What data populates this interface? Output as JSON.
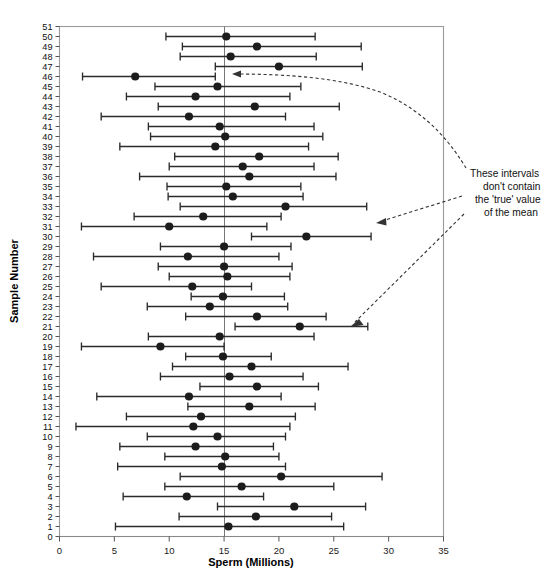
{
  "chart_data": {
    "type": "scatter",
    "title": "",
    "xlabel": "Sperm (Millions)",
    "ylabel": "Sample Number",
    "xlim": [
      0,
      35
    ],
    "ylim": [
      0,
      51
    ],
    "xticks": [
      0,
      5,
      10,
      15,
      20,
      25,
      30,
      35
    ],
    "xticklabels": [
      "0",
      "5",
      "10",
      "15",
      "20",
      "25",
      "30",
      "35"
    ],
    "yticks": [
      0,
      1,
      2,
      3,
      4,
      5,
      6,
      7,
      8,
      9,
      10,
      11,
      12,
      13,
      14,
      15,
      16,
      17,
      18,
      19,
      20,
      21,
      22,
      23,
      24,
      25,
      26,
      27,
      28,
      29,
      30,
      31,
      32,
      33,
      34,
      35,
      36,
      37,
      38,
      39,
      40,
      41,
      42,
      43,
      44,
      45,
      46,
      47,
      48,
      49,
      50,
      51
    ],
    "grid": false,
    "legend": null,
    "reference_line": {
      "x": 15.0,
      "label": "true mean"
    },
    "series": [
      {
        "name": "95% Confidence Intervals",
        "point_label": "sample mean",
        "interval_label": "confidence interval",
        "points": [
          {
            "sample": 50,
            "mean": 15.2,
            "low": 9.7,
            "high": 23.3,
            "contains_true": true
          },
          {
            "sample": 49,
            "mean": 18.0,
            "low": 11.2,
            "high": 27.5,
            "contains_true": true
          },
          {
            "sample": 48,
            "mean": 15.6,
            "low": 11.0,
            "high": 23.4,
            "contains_true": true
          },
          {
            "sample": 47,
            "mean": 20.0,
            "low": 14.2,
            "high": 27.6,
            "contains_true": true
          },
          {
            "sample": 46,
            "mean": 6.9,
            "low": 2.1,
            "high": 14.2,
            "contains_true": false
          },
          {
            "sample": 45,
            "mean": 14.4,
            "low": 8.7,
            "high": 22.0,
            "contains_true": true
          },
          {
            "sample": 44,
            "mean": 12.4,
            "low": 6.1,
            "high": 21.0,
            "contains_true": true
          },
          {
            "sample": 43,
            "mean": 17.8,
            "low": 9.0,
            "high": 25.5,
            "contains_true": true
          },
          {
            "sample": 42,
            "mean": 11.8,
            "low": 3.8,
            "high": 20.6,
            "contains_true": true
          },
          {
            "sample": 41,
            "mean": 14.6,
            "low": 8.1,
            "high": 23.2,
            "contains_true": true
          },
          {
            "sample": 40,
            "mean": 15.1,
            "low": 8.3,
            "high": 24.0,
            "contains_true": true
          },
          {
            "sample": 39,
            "mean": 14.2,
            "low": 5.5,
            "high": 22.7,
            "contains_true": true
          },
          {
            "sample": 38,
            "mean": 18.2,
            "low": 10.5,
            "high": 25.4,
            "contains_true": true
          },
          {
            "sample": 37,
            "mean": 16.7,
            "low": 10.0,
            "high": 23.2,
            "contains_true": true
          },
          {
            "sample": 36,
            "mean": 17.3,
            "low": 7.3,
            "high": 25.2,
            "contains_true": true
          },
          {
            "sample": 35,
            "mean": 15.2,
            "low": 9.8,
            "high": 22.0,
            "contains_true": true
          },
          {
            "sample": 34,
            "mean": 15.8,
            "low": 9.9,
            "high": 22.2,
            "contains_true": true
          },
          {
            "sample": 33,
            "mean": 20.6,
            "low": 11.0,
            "high": 28.0,
            "contains_true": true
          },
          {
            "sample": 32,
            "mean": 13.1,
            "low": 6.8,
            "high": 20.2,
            "contains_true": true
          },
          {
            "sample": 31,
            "mean": 10.0,
            "low": 2.0,
            "high": 18.9,
            "contains_true": true
          },
          {
            "sample": 30,
            "mean": 22.5,
            "low": 17.5,
            "high": 28.4,
            "contains_true": false
          },
          {
            "sample": 29,
            "mean": 15.0,
            "low": 9.2,
            "high": 21.1,
            "contains_true": true
          },
          {
            "sample": 28,
            "mean": 11.7,
            "low": 3.1,
            "high": 20.0,
            "contains_true": true
          },
          {
            "sample": 27,
            "mean": 15.0,
            "low": 9.0,
            "high": 21.2,
            "contains_true": true
          },
          {
            "sample": 26,
            "mean": 15.3,
            "low": 10.0,
            "high": 21.0,
            "contains_true": true
          },
          {
            "sample": 25,
            "mean": 12.1,
            "low": 3.8,
            "high": 17.5,
            "contains_true": true
          },
          {
            "sample": 24,
            "mean": 14.9,
            "low": 12.0,
            "high": 20.5,
            "contains_true": true
          },
          {
            "sample": 23,
            "mean": 13.7,
            "low": 8.0,
            "high": 20.8,
            "contains_true": true
          },
          {
            "sample": 22,
            "mean": 18.0,
            "low": 11.5,
            "high": 24.3,
            "contains_true": true
          },
          {
            "sample": 21,
            "mean": 21.9,
            "low": 16.0,
            "high": 28.1,
            "contains_true": false
          },
          {
            "sample": 20,
            "mean": 14.6,
            "low": 8.1,
            "high": 23.2,
            "contains_true": true
          },
          {
            "sample": 19,
            "mean": 9.2,
            "low": 2.0,
            "high": 15.0,
            "contains_true": true
          },
          {
            "sample": 18,
            "mean": 14.9,
            "low": 11.5,
            "high": 19.3,
            "contains_true": true
          },
          {
            "sample": 17,
            "mean": 17.5,
            "low": 10.3,
            "high": 26.3,
            "contains_true": true
          },
          {
            "sample": 16,
            "mean": 15.5,
            "low": 9.2,
            "high": 22.2,
            "contains_true": true
          },
          {
            "sample": 15,
            "mean": 18.0,
            "low": 12.8,
            "high": 23.6,
            "contains_true": true
          },
          {
            "sample": 14,
            "mean": 11.8,
            "low": 3.4,
            "high": 20.2,
            "contains_true": true
          },
          {
            "sample": 13,
            "mean": 17.3,
            "low": 11.7,
            "high": 23.3,
            "contains_true": true
          },
          {
            "sample": 12,
            "mean": 12.9,
            "low": 6.1,
            "high": 21.5,
            "contains_true": true
          },
          {
            "sample": 11,
            "mean": 12.2,
            "low": 1.5,
            "high": 21.0,
            "contains_true": true
          },
          {
            "sample": 10,
            "mean": 14.4,
            "low": 8.0,
            "high": 20.6,
            "contains_true": true
          },
          {
            "sample": 9,
            "mean": 12.4,
            "low": 5.5,
            "high": 19.5,
            "contains_true": true
          },
          {
            "sample": 8,
            "mean": 15.1,
            "low": 9.6,
            "high": 20.0,
            "contains_true": true
          },
          {
            "sample": 7,
            "mean": 14.8,
            "low": 5.3,
            "high": 20.6,
            "contains_true": true
          },
          {
            "sample": 6,
            "mean": 20.2,
            "low": 11.0,
            "high": 29.4,
            "contains_true": true
          },
          {
            "sample": 5,
            "mean": 16.6,
            "low": 9.6,
            "high": 25.0,
            "contains_true": true
          },
          {
            "sample": 4,
            "mean": 11.6,
            "low": 5.8,
            "high": 18.6,
            "contains_true": true
          },
          {
            "sample": 3,
            "mean": 21.4,
            "low": 14.4,
            "high": 27.9,
            "contains_true": true
          },
          {
            "sample": 2,
            "mean": 17.9,
            "low": 10.9,
            "high": 24.8,
            "contains_true": true
          },
          {
            "sample": 1,
            "mean": 15.4,
            "low": 5.1,
            "high": 25.9,
            "contains_true": true
          }
        ]
      }
    ],
    "annotations": [
      {
        "id": "outliers-note",
        "lines": [
          "These intervals",
          "don't contain",
          "the 'true' value",
          "of the mean"
        ],
        "points_to_samples": [
          46,
          30,
          21
        ]
      }
    ]
  },
  "axes": {
    "x_title": "Sperm (Millions)",
    "y_title": "Sample Number"
  }
}
